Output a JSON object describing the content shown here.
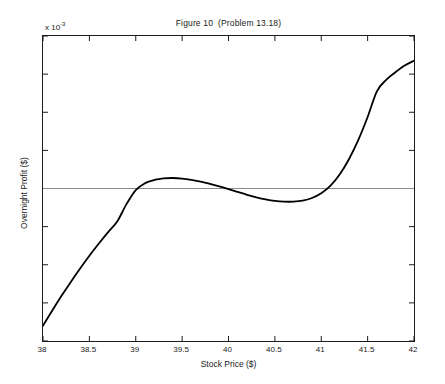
{
  "figure": {
    "title": "Figure 10  (Problem 13.18)",
    "y_exponent_prefix": "x 10",
    "y_exponent_power": "-3",
    "background_color": "#ffffff",
    "curve_color": "#000000",
    "axis_color": "#1a1a1a",
    "zeroline_color": "#8c8c8c"
  },
  "chart_data": {
    "type": "line",
    "title": "Figure 10  (Problem 13.18)",
    "xlabel": "Stock Price ($)",
    "ylabel": "Overnight Profit ($)",
    "xlim": [
      38,
      42
    ],
    "ylim": [
      -0.008,
      0.008
    ],
    "y_scale_exponent": -3,
    "grid": false,
    "legend": null,
    "xticks": [
      38,
      38.5,
      39,
      39.5,
      40,
      40.5,
      41,
      41.5,
      42
    ],
    "xticklabels": [
      "38",
      "38.5",
      "39",
      "39.5",
      "40",
      "40.5",
      "41",
      "41.5",
      "42"
    ],
    "yticks": [
      -0.008,
      -0.006,
      -0.004,
      -0.002,
      0,
      0.002,
      0.004,
      0.006,
      0.008
    ],
    "yticklabels": [
      "-8",
      "-6",
      "-4",
      "-2",
      "0",
      "2",
      "4",
      "6",
      "8"
    ],
    "reference_lines": [
      {
        "orientation": "horizontal",
        "y": 0,
        "color": "#8c8c8c"
      }
    ],
    "series": [
      {
        "name": "Overnight Profit",
        "color": "#000000",
        "x": [
          38.0,
          38.1,
          38.2,
          38.3,
          38.4,
          38.5,
          38.6,
          38.7,
          38.8,
          38.9,
          39.0,
          39.1,
          39.2,
          39.3,
          39.4,
          39.5,
          39.6,
          39.7,
          39.8,
          39.9,
          40.0,
          40.1,
          40.2,
          40.3,
          40.4,
          40.5,
          40.6,
          40.7,
          40.8,
          40.9,
          41.0,
          41.1,
          41.2,
          41.3,
          41.4,
          41.5,
          41.6,
          41.7,
          41.8,
          41.9,
          42.0
        ],
        "y": [
          -0.0072,
          -0.0064,
          -0.00563,
          -0.0049,
          -0.0042,
          -0.00353,
          -0.0029,
          -0.0023,
          -0.00173,
          -0.00082,
          -8e-05,
          0.00028,
          0.00045,
          0.00053,
          0.00055,
          0.00052,
          0.00045,
          0.00036,
          0.00024,
          0.00011,
          -3e-05,
          -0.00018,
          -0.00033,
          -0.00046,
          -0.00057,
          -0.00065,
          -0.00069,
          -0.00069,
          -0.00064,
          -0.0005,
          -0.00025,
          0.00015,
          0.00075,
          0.00155,
          0.00255,
          0.00375,
          0.0051,
          0.0057,
          0.0061,
          0.00645,
          0.0067
        ],
        "annotations": {
          "left_endpoint": -0.0072,
          "right_endpoint": 0.0067,
          "local_max": {
            "x": 39.4,
            "y": 0.00055
          },
          "local_min": {
            "x": 40.65,
            "y": -0.0007
          },
          "zero_crossings": [
            39.01,
            39.97,
            41.06
          ]
        }
      }
    ]
  }
}
